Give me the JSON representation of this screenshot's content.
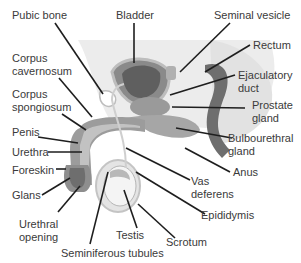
{
  "diagram": {
    "type": "anatomical",
    "colors": {
      "background": "#ffffff",
      "pelvis_shade": "#ebebeb",
      "tissue_dark": "#6e6e6e",
      "tissue_mid": "#9a9a9a",
      "tissue_light": "#c8c8c8",
      "leader_line": "#1e1e1e",
      "label_text": "#3a3a3a"
    },
    "labels": {
      "pubic_bone": "Pubic bone",
      "bladder": "Bladder",
      "seminal_vesicle": "Seminal vesicle",
      "rectum": "Rectum",
      "corpus_cavernosum_1": "Corpus",
      "corpus_cavernosum_2": "cavernosum",
      "ejaculatory_duct_1": "Ejaculatory",
      "ejaculatory_duct_2": "duct",
      "corpus_spongiosum_1": "Corpus",
      "corpus_spongiosum_2": "spongiosum",
      "prostate_gland_1": "Prostate",
      "prostate_gland_2": "gland",
      "penis": "Penis",
      "bulbourethral_gland_1": "Bulbourethral",
      "bulbourethral_gland_2": "gland",
      "urethra": "Urethra",
      "foreskin": "Foreskin",
      "anus": "Anus",
      "glans": "Glans",
      "vas_deferens_1": "Vas",
      "vas_deferens_2": "deferens",
      "epididymis": "Epididymis",
      "urethral_opening_1": "Urethral",
      "urethral_opening_2": "opening",
      "testis": "Testis",
      "scrotum": "Scrotum",
      "seminiferous_tubules": "Seminiferous tubules"
    }
  }
}
